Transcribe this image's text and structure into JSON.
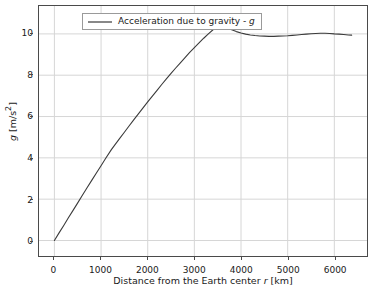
{
  "chart_data": {
    "type": "line",
    "title": "",
    "xlabel": "Distance from the Earth center r [km]",
    "xlabel_parts": {
      "pre": "Distance from the Earth center ",
      "italic": "r",
      "post": " [km]"
    },
    "ylabel": "g [m/s²]",
    "ylabel_parts": {
      "italic": "g",
      "post": " [m/s",
      "sup": "2",
      "tail": "]"
    },
    "xlim": [
      -330,
      6700
    ],
    "ylim": [
      -0.75,
      11.35
    ],
    "xticks": [
      0,
      1000,
      2000,
      3000,
      4000,
      5000,
      6000
    ],
    "xticklabels": [
      "0",
      "1000",
      "2000",
      "3000",
      "4000",
      "5000",
      "6000"
    ],
    "yticks": [
      0,
      2,
      4,
      6,
      8,
      10
    ],
    "yticklabels": [
      "0",
      "2",
      "4",
      "6",
      "8",
      "10"
    ],
    "grid": true,
    "grid_color": "#d6d6d6",
    "frame_color": "#4a4a4a",
    "background": "#ffffff",
    "legend": {
      "position": "upper left",
      "entries": [
        {
          "label": "Acceleration due to gravity - g",
          "label_pre": "Acceleration due to gravity - ",
          "label_italic": "g",
          "color": "#3a3a3a"
        }
      ]
    },
    "series": [
      {
        "name": "Acceleration due to gravity - g",
        "color": "#3a3a3a",
        "linewidth": 1.1,
        "x": [
          0,
          100,
          200,
          300,
          400,
          500,
          600,
          700,
          800,
          900,
          1000,
          1100,
          1221,
          1300,
          1400,
          1500,
          1600,
          1700,
          1800,
          1900,
          2000,
          2100,
          2200,
          2300,
          2400,
          2500,
          2600,
          2700,
          2800,
          2900,
          3000,
          3100,
          3200,
          3300,
          3400,
          3480,
          3600,
          3700,
          3800,
          3900,
          4000,
          4100,
          4200,
          4300,
          4400,
          4500,
          4600,
          4700,
          4800,
          4900,
          5000,
          5100,
          5200,
          5300,
          5400,
          5500,
          5600,
          5700,
          5800,
          5900,
          6000,
          6100,
          6200,
          6300,
          6371
        ],
        "y": [
          0.0,
          0.37,
          0.73,
          1.1,
          1.46,
          1.82,
          2.19,
          2.55,
          2.91,
          3.27,
          3.62,
          3.98,
          4.4,
          4.64,
          4.94,
          5.24,
          5.54,
          5.84,
          6.13,
          6.42,
          6.71,
          6.99,
          7.27,
          7.55,
          7.82,
          8.09,
          8.35,
          8.6,
          8.85,
          9.1,
          9.33,
          9.56,
          9.79,
          10.0,
          10.2,
          10.58,
          10.4,
          10.3,
          10.2,
          10.11,
          10.04,
          9.99,
          9.95,
          9.92,
          9.9,
          9.89,
          9.88,
          9.88,
          9.89,
          9.9,
          9.91,
          9.93,
          9.95,
          9.97,
          9.99,
          10.01,
          10.02,
          10.03,
          10.03,
          10.02,
          10.0,
          9.99,
          9.97,
          9.95,
          9.94
        ]
      }
    ],
    "annotations": []
  }
}
